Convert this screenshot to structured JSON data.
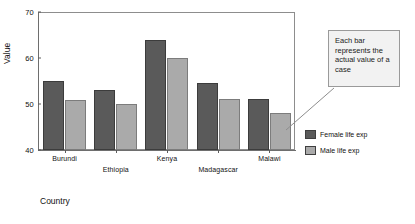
{
  "chart_data": {
    "type": "bar",
    "title": "",
    "xlabel": "Country",
    "ylabel": "Value",
    "categories": [
      "Burundi",
      "Ethiopia",
      "Kenya",
      "Madagascar",
      "Malawi"
    ],
    "series": [
      {
        "name": "Female life exp",
        "color": "#5a5a5a",
        "values": [
          55,
          53,
          64,
          54.5,
          51
        ]
      },
      {
        "name": "Male life exp",
        "color": "#aaaaaa",
        "values": [
          50.8,
          50,
          60,
          51,
          48
        ]
      }
    ],
    "ylim": [
      40,
      70
    ],
    "yticks": [
      40,
      50,
      60,
      70
    ],
    "grid": false,
    "legend_position": "right",
    "annotations": [
      {
        "text": "Each bar represents the actual value of a case",
        "target": "Malawi male bar"
      }
    ]
  },
  "annotation": {
    "text": "Each bar represents the actual value of a case"
  },
  "axis": {
    "y_title": "Value",
    "x_title": "Country"
  }
}
